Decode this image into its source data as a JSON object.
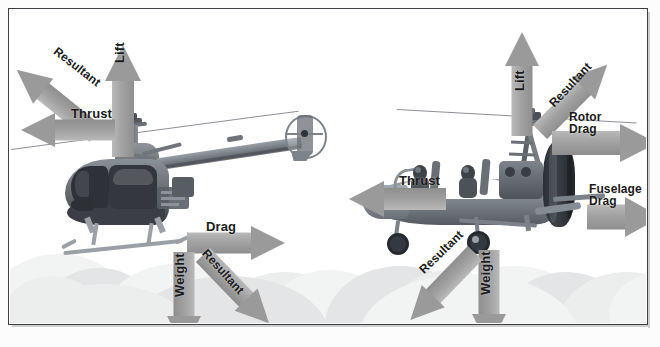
{
  "figure": {
    "type": "force-diagram",
    "background": "sky-with-clouds",
    "frame_color": "#3c3f44",
    "arrow_color": "#9a9a9a",
    "label_color": "#1b1b1b"
  },
  "left_panel": {
    "name": "helicopter",
    "aircraft": "two-seat piston helicopter (Robinson R22 style)",
    "flight_direction": "left (forward flight to the left)",
    "labels": {
      "lift": "Lift",
      "resultant_top": "Resultant",
      "thrust": "Thrust",
      "drag": "Drag",
      "weight": "Weight",
      "resultant_bottom": "Resultant"
    },
    "arrows": [
      {
        "name": "lift",
        "label": "Lift",
        "direction": "up",
        "angle_deg": -90
      },
      {
        "name": "resultant-upper",
        "label": "Resultant",
        "direction": "up-left",
        "angle_deg": -135
      },
      {
        "name": "thrust",
        "label": "Thrust",
        "direction": "left",
        "angle_deg": 180
      },
      {
        "name": "drag",
        "label": "Drag",
        "direction": "right",
        "angle_deg": 0
      },
      {
        "name": "weight",
        "label": "Weight",
        "direction": "down",
        "angle_deg": 90
      },
      {
        "name": "resultant-lower",
        "label": "Resultant",
        "direction": "down-right",
        "angle_deg": 45
      }
    ]
  },
  "right_panel": {
    "name": "gyroplane",
    "aircraft": "open-frame tandem gyroplane with pusher propeller",
    "flight_direction": "left (forward flight to the left)",
    "labels": {
      "lift": "Lift",
      "resultant_top": "Resultant",
      "rotor_drag": "Rotor\nDrag",
      "thrust": "Thrust",
      "fuselage_drag": "Fuselage\nDrag",
      "weight": "Weight",
      "resultant_bottom": "Resultant"
    },
    "arrows": [
      {
        "name": "lift",
        "label": "Lift",
        "direction": "up",
        "angle_deg": -90
      },
      {
        "name": "resultant-upper",
        "label": "Resultant",
        "direction": "up-right",
        "angle_deg": -45
      },
      {
        "name": "rotor-drag",
        "label": "Rotor Drag",
        "direction": "right",
        "angle_deg": 0
      },
      {
        "name": "thrust",
        "label": "Thrust",
        "direction": "left",
        "angle_deg": 180
      },
      {
        "name": "fuselage-drag",
        "label": "Fuselage Drag",
        "direction": "right",
        "angle_deg": 0
      },
      {
        "name": "weight",
        "label": "Weight",
        "direction": "down",
        "angle_deg": 90
      },
      {
        "name": "resultant-lower",
        "label": "Resultant",
        "direction": "down-left",
        "angle_deg": 135
      }
    ]
  }
}
